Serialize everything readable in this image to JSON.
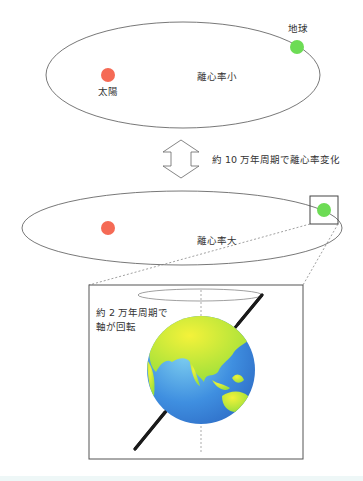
{
  "diagram": {
    "type": "orbital-cycles",
    "colors": {
      "sun": "#f56a55",
      "earth_dot": "#6ddc55",
      "orbit_line": "#555555",
      "axis": "#1a1a1a",
      "ocean": "#3f8fe0",
      "land": "#c8ee3a",
      "background": "#ffffff",
      "bottom_band": "#eef7f7"
    },
    "top_orbit": {
      "eccentricity_label": "離心率小",
      "sun_label": "太陽",
      "earth_label": "地球"
    },
    "transition": {
      "label": "約 10 万年周期で離心率変化",
      "arrow": "double-vertical-arrow"
    },
    "bottom_orbit": {
      "eccentricity_label": "離心率大"
    },
    "inset": {
      "label_line1": "約 2 万年周期で",
      "label_line2": "軸が回転"
    }
  }
}
